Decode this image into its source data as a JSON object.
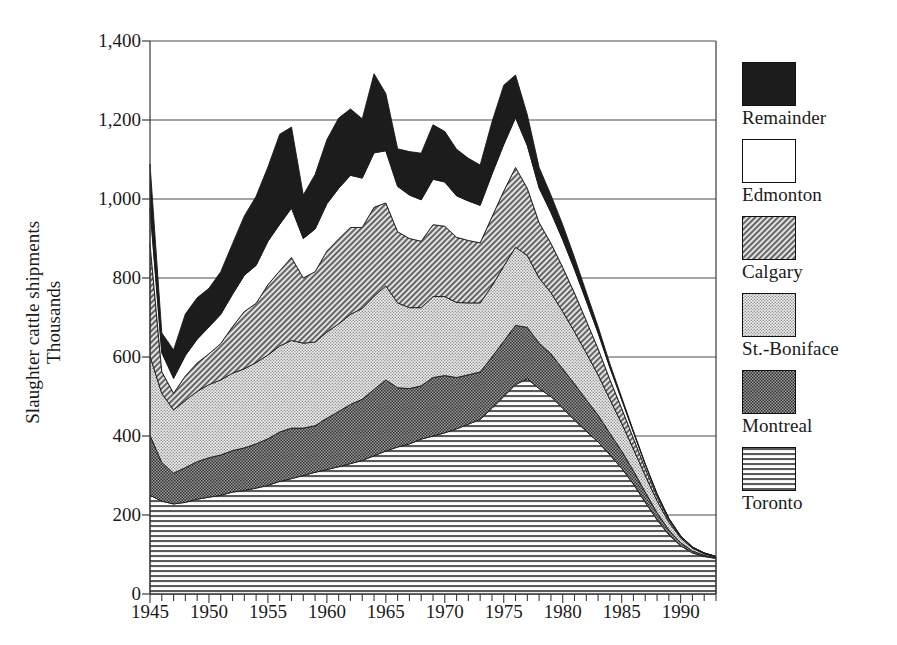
{
  "figure": {
    "ylabel_line1": "Slaughter cattle shipments",
    "ylabel_line2": "Thousands"
  },
  "chart_data": {
    "type": "area",
    "stacked": true,
    "title": "",
    "xlabel": "",
    "ylabel": "Slaughter cattle shipments Thousands",
    "xlim": [
      1945,
      1993
    ],
    "ylim": [
      0,
      1400
    ],
    "ytick_labels": [
      "0",
      "200",
      "400",
      "600",
      "800",
      "1,000",
      "1,200",
      "1,400"
    ],
    "ytick_values": [
      0,
      200,
      400,
      600,
      800,
      1000,
      1200,
      1400
    ],
    "xtick_labels": [
      "1945",
      "1950",
      "1955",
      "1960",
      "1965",
      "1970",
      "1975",
      "1980",
      "1985",
      "1990"
    ],
    "xtick_values": [
      1945,
      1950,
      1955,
      1960,
      1965,
      1970,
      1975,
      1980,
      1985,
      1990
    ],
    "minor_xticks_every": 1,
    "grid": "horizontal",
    "legend_position": "right",
    "x": [
      1945,
      1946,
      1947,
      1948,
      1949,
      1950,
      1951,
      1952,
      1953,
      1954,
      1955,
      1956,
      1957,
      1958,
      1959,
      1960,
      1961,
      1962,
      1963,
      1964,
      1965,
      1966,
      1967,
      1968,
      1969,
      1970,
      1971,
      1972,
      1973,
      1974,
      1975,
      1976,
      1977,
      1978,
      1979,
      1980,
      1981,
      1982,
      1983,
      1984,
      1985,
      1986,
      1987,
      1988,
      1989,
      1990,
      1991,
      1992,
      1993
    ],
    "series": [
      {
        "name": "Toronto",
        "pattern": "horizontal-stripes",
        "color": "#d8d8d8",
        "values": [
          250,
          235,
          228,
          232,
          240,
          245,
          250,
          258,
          262,
          268,
          275,
          285,
          292,
          300,
          308,
          315,
          322,
          330,
          338,
          350,
          362,
          372,
          380,
          392,
          400,
          408,
          418,
          430,
          442,
          470,
          500,
          530,
          545,
          520,
          500,
          470,
          440,
          412,
          385,
          352,
          318,
          278,
          232,
          188,
          150,
          122,
          104,
          95,
          90
        ]
      },
      {
        "name": "Montreal",
        "pattern": "dark-dots",
        "color": "#767676",
        "values": [
          152,
          98,
          78,
          88,
          95,
          100,
          102,
          105,
          108,
          112,
          118,
          125,
          128,
          120,
          118,
          130,
          140,
          150,
          155,
          168,
          180,
          150,
          140,
          135,
          148,
          145,
          130,
          125,
          120,
          130,
          140,
          150,
          130,
          115,
          108,
          100,
          92,
          80,
          68,
          55,
          44,
          34,
          26,
          18,
          12,
          8,
          5,
          3,
          2
        ]
      },
      {
        "name": "St.-Boniface",
        "pattern": "light-dots",
        "color": "#bdbdbd",
        "values": [
          200,
          175,
          160,
          170,
          178,
          185,
          190,
          196,
          200,
          206,
          212,
          218,
          222,
          215,
          212,
          218,
          222,
          228,
          230,
          236,
          238,
          215,
          205,
          198,
          205,
          200,
          190,
          182,
          175,
          180,
          190,
          198,
          182,
          165,
          155,
          145,
          132,
          118,
          102,
          86,
          70,
          55,
          42,
          30,
          20,
          12,
          7,
          4,
          2
        ]
      },
      {
        "name": "Calgary",
        "pattern": "diagonal-hatch",
        "color": "#8f8f8f",
        "values": [
          285,
          55,
          42,
          62,
          72,
          78,
          92,
          118,
          145,
          150,
          178,
          190,
          210,
          165,
          178,
          205,
          215,
          220,
          205,
          225,
          210,
          180,
          175,
          168,
          182,
          178,
          165,
          158,
          152,
          175,
          190,
          202,
          170,
          140,
          125,
          112,
          98,
          82,
          66,
          50,
          38,
          27,
          18,
          11,
          6,
          3,
          2,
          1,
          1
        ]
      },
      {
        "name": "Edmonton",
        "pattern": "white",
        "color": "#ffffff",
        "values": [
          90,
          48,
          38,
          52,
          60,
          68,
          74,
          82,
          92,
          96,
          110,
          118,
          125,
          100,
          108,
          120,
          128,
          132,
          125,
          138,
          132,
          115,
          110,
          105,
          115,
          112,
          105,
          100,
          95,
          108,
          118,
          126,
          108,
          88,
          78,
          70,
          60,
          50,
          40,
          30,
          22,
          15,
          10,
          6,
          3,
          2,
          1,
          1,
          0
        ]
      },
      {
        "name": "Remainder",
        "pattern": "solid-black",
        "color": "#1a1a1a",
        "values": [
          112,
          50,
          72,
          105,
          105,
          98,
          108,
          128,
          150,
          175,
          188,
          228,
          205,
          110,
          138,
          162,
          178,
          168,
          150,
          200,
          145,
          95,
          110,
          118,
          138,
          128,
          118,
          108,
          102,
          132,
          150,
          108,
          78,
          52,
          44,
          38,
          30,
          22,
          16,
          10,
          6,
          4,
          2,
          1,
          1,
          0,
          0,
          0,
          0
        ]
      }
    ]
  },
  "legend": {
    "items": [
      {
        "label": "Remainder",
        "pattern": "solid-black"
      },
      {
        "label": "Edmonton",
        "pattern": "white"
      },
      {
        "label": "Calgary",
        "pattern": "diagonal-hatch"
      },
      {
        "label": "St.-Boniface",
        "pattern": "light-dots"
      },
      {
        "label": "Montreal",
        "pattern": "dark-dots"
      },
      {
        "label": "Toronto",
        "pattern": "horizontal-stripes"
      }
    ]
  }
}
